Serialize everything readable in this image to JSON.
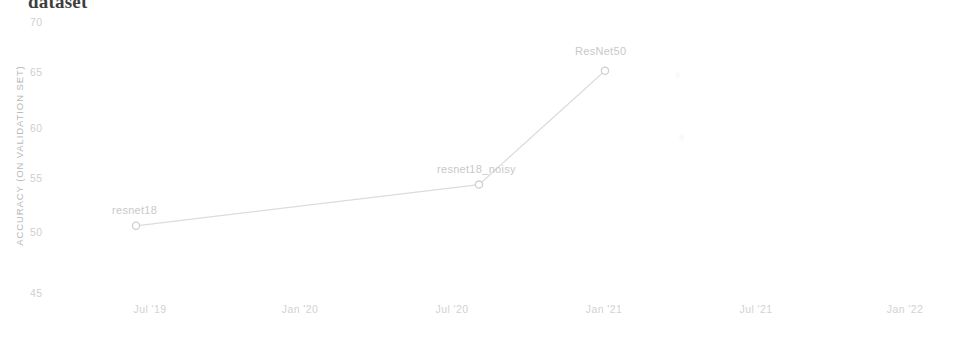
{
  "title": "dataset",
  "chart_data": {
    "type": "line",
    "title": "dataset",
    "xlabel": "",
    "ylabel": "ACCURACY (ON VALIDATION SET)",
    "ylim": [
      45,
      70
    ],
    "y_ticks": [
      "70",
      "65",
      "60",
      "55",
      "50",
      "45"
    ],
    "x_ticks": [
      "Jul '19",
      "Jan '20",
      "Jul '20",
      "Jan '21",
      "Jul '21",
      "Jan '22"
    ],
    "grid": false,
    "legend": "none",
    "line_color": "#dcdcdc",
    "marker_color": "#d0d0d0",
    "points": [
      {
        "label": "resnet18",
        "x_tick": "Jul '19",
        "x_px": 136,
        "y_value": 51.2
      },
      {
        "label": "resnet18_noisy",
        "x_tick": "Jul '20",
        "x_px": 479,
        "y_value": 55.0
      },
      {
        "label": "ResNet50",
        "x_tick": "Jan '21",
        "x_px": 605,
        "y_value": 65.5
      }
    ],
    "series": [
      {
        "name": "accuracy",
        "categories": [
          "resnet18",
          "resnet18_noisy",
          "ResNet50"
        ],
        "values": [
          51.2,
          55.0,
          65.5
        ]
      }
    ]
  }
}
